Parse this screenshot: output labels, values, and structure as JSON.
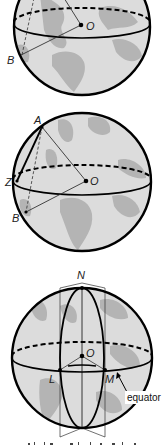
{
  "figure": {
    "globe1": {
      "labels": {
        "O": "O",
        "B": "B"
      }
    },
    "globe2": {
      "labels": {
        "A": "A",
        "Z": "Z",
        "O": "O",
        "B": "B"
      }
    },
    "globe3": {
      "labels": {
        "N": "N",
        "O": "O",
        "L": "L",
        "M": "M",
        "equator": "equator"
      }
    },
    "colors": {
      "sphere_fill": "#dcdcdc",
      "land_fill": "#b4b4b4",
      "outline": "#000000",
      "background": "#ffffff"
    },
    "caption_partial": ""
  }
}
